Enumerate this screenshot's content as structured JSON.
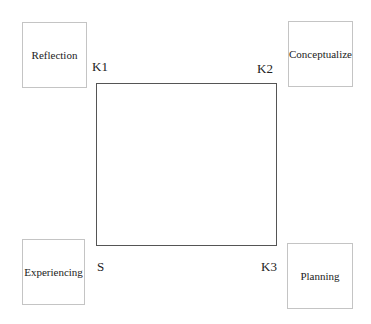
{
  "diagram": {
    "type": "learning-cycle-square",
    "nodes": [
      {
        "id": "reflection",
        "label": "Reflection",
        "position": "top-left"
      },
      {
        "id": "conceptualize",
        "label": "Conceptualize",
        "position": "top-right"
      },
      {
        "id": "experiencing",
        "label": "Experiencing",
        "position": "bottom-left"
      },
      {
        "id": "planning",
        "label": "Planning",
        "position": "bottom-right"
      }
    ],
    "corners": {
      "k1": "K1",
      "k2": "K2",
      "s": "S",
      "k3": "K3"
    },
    "colors": {
      "box_border": "#c4c4c4",
      "square_border": "#555555",
      "text": "#222222"
    }
  }
}
